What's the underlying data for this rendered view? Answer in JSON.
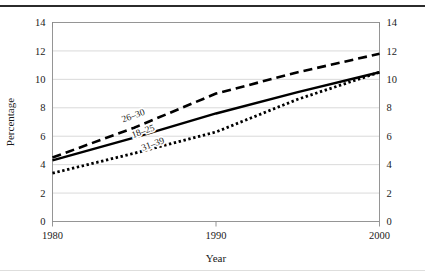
{
  "chart_data": {
    "type": "line",
    "title": "",
    "xlabel": "Year",
    "ylabel": "Percentage",
    "xlim": [
      1980,
      2000
    ],
    "ylim": [
      0,
      14
    ],
    "grid": true,
    "legend_position": "inline-on-curve",
    "x_ticks": [
      "1980",
      "1990",
      "2000"
    ],
    "x_tick_values": [
      1980,
      1990,
      2000
    ],
    "y_ticks": [
      "0",
      "2",
      "4",
      "6",
      "8",
      "10",
      "12",
      "14"
    ],
    "y_tick_values": [
      0,
      2,
      4,
      6,
      8,
      10,
      12,
      14
    ],
    "right_axis_ticks": [
      "0",
      "2",
      "4",
      "6",
      "8",
      "10",
      "12",
      "14"
    ],
    "x": [
      1980,
      1985,
      1990,
      1995,
      2000
    ],
    "series": [
      {
        "name": "26-30",
        "label": "26–30",
        "style": "dashed",
        "values": [
          4.5,
          6.6,
          9.0,
          10.5,
          11.8
        ],
        "label_x": 1985.0,
        "label_y": 7.25
      },
      {
        "name": "18-25",
        "label": "18–25",
        "style": "solid",
        "values": [
          4.3,
          5.9,
          7.6,
          9.1,
          10.5
        ],
        "label_x": 1985.6,
        "label_y": 6.15
      },
      {
        "name": "31-39",
        "label": "31–39",
        "style": "dotted",
        "values": [
          3.4,
          4.8,
          6.3,
          8.6,
          10.5
        ],
        "label_x": 1986.2,
        "label_y": 5.25
      }
    ]
  },
  "colors": {
    "line": "#000000",
    "grid": "#c9c9c9",
    "frame": "#8a8a8a",
    "text": "#1a1a1a",
    "top_rule": "#2b2b2b",
    "background": "#ffffff"
  }
}
